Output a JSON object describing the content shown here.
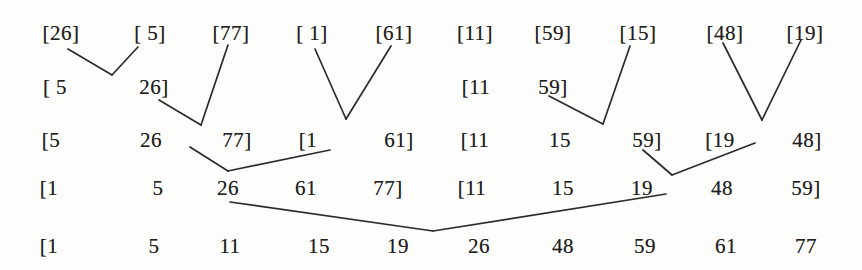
{
  "diagram": {
    "kind": "merge-sort-trace",
    "background": "#fdfdfb",
    "ink": "#1f1f1f",
    "line_color": "#2b2b2b",
    "line_width": 1.7,
    "font_size": 21,
    "rows": [
      {
        "name": "pass-0-single-element-runs",
        "y": 33,
        "tokens": [
          {
            "x": 61,
            "text": "[26]"
          },
          {
            "x": 150,
            "text": "[ 5]"
          },
          {
            "x": 231,
            "text": "[77]"
          },
          {
            "x": 312,
            "text": "[ 1]"
          },
          {
            "x": 394,
            "text": "[61]"
          },
          {
            "x": 475,
            "text": "[11]"
          },
          {
            "x": 553,
            "text": "[59]"
          },
          {
            "x": 638,
            "text": "[15]"
          },
          {
            "x": 725,
            "text": "[48]"
          },
          {
            "x": 805,
            "text": "[19]"
          }
        ]
      },
      {
        "name": "pass-1-intermediate-pairs",
        "y": 87,
        "tokens": [
          {
            "x": 55,
            "text": "[ 5"
          },
          {
            "x": 154,
            "text": "26]"
          },
          {
            "x": 476,
            "text": "[11"
          },
          {
            "x": 553,
            "text": "59]"
          }
        ]
      },
      {
        "name": "pass-1-results-runs-of-three",
        "y": 140,
        "tokens": [
          {
            "x": 51,
            "text": "[5"
          },
          {
            "x": 151,
            "text": "26"
          },
          {
            "x": 237,
            "text": "77]"
          },
          {
            "x": 308,
            "text": "[1"
          },
          {
            "x": 399,
            "text": "61]"
          },
          {
            "x": 475,
            "text": "[11"
          },
          {
            "x": 560,
            "text": "15"
          },
          {
            "x": 647,
            "text": "59]"
          },
          {
            "x": 720,
            "text": "[19"
          },
          {
            "x": 807,
            "text": "48]"
          }
        ]
      },
      {
        "name": "pass-2-results-runs-of-five",
        "y": 188,
        "tokens": [
          {
            "x": 49,
            "text": "[1"
          },
          {
            "x": 158,
            "text": "5"
          },
          {
            "x": 228,
            "text": "26"
          },
          {
            "x": 306,
            "text": "61"
          },
          {
            "x": 388,
            "text": "77]"
          },
          {
            "x": 472,
            "text": "[11"
          },
          {
            "x": 563,
            "text": "15"
          },
          {
            "x": 642,
            "text": "19"
          },
          {
            "x": 722,
            "text": "48"
          },
          {
            "x": 806,
            "text": "59]"
          }
        ]
      },
      {
        "name": "final-sorted-array",
        "y": 246,
        "tokens": [
          {
            "x": 49,
            "text": "[1"
          },
          {
            "x": 154,
            "text": "5"
          },
          {
            "x": 230,
            "text": "11"
          },
          {
            "x": 319,
            "text": "15"
          },
          {
            "x": 398,
            "text": "19"
          },
          {
            "x": 479,
            "text": "26"
          },
          {
            "x": 563,
            "text": "48"
          },
          {
            "x": 645,
            "text": "59"
          },
          {
            "x": 726,
            "text": "61"
          },
          {
            "x": 806,
            "text": "77"
          }
        ]
      }
    ],
    "merge_lines": [
      {
        "name": "merge-26-5-left-arm",
        "x1": 68,
        "y1": 49,
        "x2": 112,
        "y2": 75
      },
      {
        "name": "merge-26-5-right-arm",
        "x1": 138,
        "y1": 47,
        "x2": 112,
        "y2": 75
      },
      {
        "name": "merge-77-arm",
        "x1": 228,
        "y1": 45,
        "x2": 201,
        "y2": 125
      },
      {
        "name": "merge-526-arm",
        "x1": 159,
        "y1": 100,
        "x2": 201,
        "y2": 125
      },
      {
        "name": "merge-1-61-left-arm",
        "x1": 315,
        "y1": 49,
        "x2": 346,
        "y2": 119
      },
      {
        "name": "merge-1-61-right-arm",
        "x1": 391,
        "y1": 46,
        "x2": 346,
        "y2": 119
      },
      {
        "name": "merge-1159-arm",
        "x1": 549,
        "y1": 96,
        "x2": 603,
        "y2": 124
      },
      {
        "name": "merge-15-arm",
        "x1": 630,
        "y1": 46,
        "x2": 603,
        "y2": 124
      },
      {
        "name": "merge-48-19-left-arm",
        "x1": 723,
        "y1": 43,
        "x2": 762,
        "y2": 120
      },
      {
        "name": "merge-48-19-right-arm",
        "x1": 801,
        "y1": 40,
        "x2": 762,
        "y2": 120
      },
      {
        "name": "pass2-left-merge-arm-a",
        "x1": 190,
        "y1": 147,
        "x2": 228,
        "y2": 171
      },
      {
        "name": "pass2-left-merge-arm-b",
        "x1": 330,
        "y1": 150,
        "x2": 228,
        "y2": 171
      },
      {
        "name": "pass2-right-merge-arm-a",
        "x1": 643,
        "y1": 150,
        "x2": 672,
        "y2": 175
      },
      {
        "name": "pass2-right-merge-arm-b",
        "x1": 755,
        "y1": 143,
        "x2": 672,
        "y2": 175
      },
      {
        "name": "final-merge-left-arm",
        "x1": 230,
        "y1": 202,
        "x2": 433,
        "y2": 231
      },
      {
        "name": "final-merge-right-arm",
        "x1": 666,
        "y1": 194,
        "x2": 433,
        "y2": 231
      }
    ]
  }
}
